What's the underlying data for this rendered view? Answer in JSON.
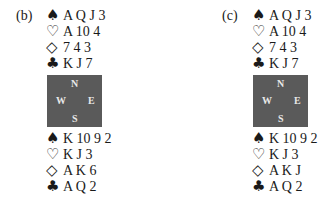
{
  "deals": [
    {
      "label": "(b)",
      "north": {
        "spades": "A Q J 3",
        "hearts": "A 10 4",
        "diamonds": "7 4 3",
        "clubs": "K J 7"
      },
      "south": {
        "spades": "K 10 9 2",
        "hearts": "K J 3",
        "diamonds": "A K 6",
        "clubs": "A Q 2"
      }
    },
    {
      "label": "(c)",
      "north": {
        "spades": "A Q J 3",
        "hearts": "A 10 4",
        "diamonds": "7 4 3",
        "clubs": "K J 7"
      },
      "south": {
        "spades": "K 10 9 2",
        "hearts": "K J 3",
        "diamonds": "A K J",
        "clubs": "A Q 2"
      }
    }
  ],
  "compass": {
    "n": "N",
    "w": "W",
    "e": "E",
    "s": "S"
  },
  "suits": {
    "spade": "♠",
    "heart": "♡",
    "diamond": "◇",
    "club": "♣"
  },
  "colors": {
    "compass_bg": "#5a5a5a",
    "compass_text": "#e8e8e8",
    "text": "#1a1a1a"
  }
}
